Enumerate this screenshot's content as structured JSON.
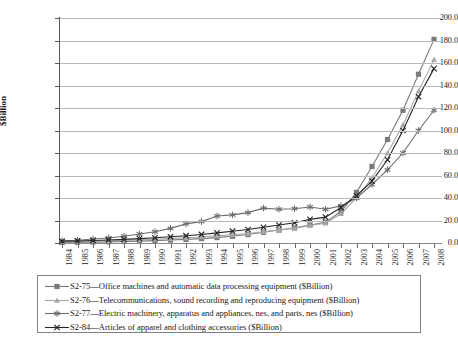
{
  "chart_data": {
    "type": "line",
    "title": "",
    "xlabel": "",
    "ylabel": "$Billion",
    "ylim": [
      0,
      200
    ],
    "ytick_step": 20,
    "grid": true,
    "legend_position": "bottom",
    "x": [
      1984,
      1985,
      1986,
      1987,
      1988,
      1989,
      1990,
      1991,
      1992,
      1993,
      1994,
      1995,
      1996,
      1997,
      1998,
      1999,
      2000,
      2001,
      2002,
      2003,
      2004,
      2005,
      2006,
      2007,
      2008
    ],
    "categories": [
      "1984",
      "1985",
      "1986",
      "1987",
      "1988",
      "1989",
      "1990",
      "1991",
      "1992",
      "1993",
      "1994",
      "1995",
      "1996",
      "1997",
      "1998",
      "1999",
      "2000",
      "2001",
      "2002",
      "2003",
      "2004",
      "2005",
      "2006",
      "2007",
      "2008"
    ],
    "ytick_labels": [
      "0.0",
      "20.0",
      "40.0",
      "60.0",
      "80.0",
      "100.0",
      "120.0",
      "140.0",
      "160.0",
      "180.0",
      "200.0"
    ],
    "series": [
      {
        "name": "S2-75-Office machines and automatic data processing equipment ($Billion)",
        "code": "S2-75",
        "description": "Office machines and automatic data processing equipment",
        "unit": "$Billion",
        "marker": "square",
        "color": "#7a7a7a",
        "values": [
          0.5,
          0.6,
          0.8,
          1.0,
          1.3,
          1.7,
          2.1,
          2.6,
          3.2,
          3.9,
          4.8,
          6.0,
          7.5,
          9.5,
          11.5,
          13.5,
          16.0,
          18.5,
          28.0,
          45.0,
          68.0,
          92.0,
          118.0,
          150.0,
          181.0
        ]
      },
      {
        "name": "S2-76-Telecommunications, sound recording and reproducing equipment ($Billion)",
        "code": "S2-76",
        "description": "Telecommunications, sound recording and reproducing equipment",
        "unit": "$Billion",
        "marker": "triangle",
        "color": "#a8a8a8",
        "values": [
          1.0,
          1.2,
          1.5,
          1.9,
          2.3,
          2.8,
          3.3,
          3.9,
          4.6,
          5.4,
          6.3,
          7.3,
          8.5,
          10.0,
          11.5,
          13.0,
          15.5,
          17.5,
          26.0,
          40.0,
          58.0,
          80.0,
          105.0,
          135.0,
          163.0
        ]
      },
      {
        "name": "S2-77-Electric machinery, apparatus and appliances, nes, and parts, nes ($Billion)",
        "code": "S2-77",
        "description": "Electric machinery, apparatus and appliances, nes, and parts, nes",
        "unit": "$Billion",
        "marker": "asterisk",
        "color": "#6e6e6e",
        "values": [
          2.0,
          2.5,
          3.5,
          4.5,
          6.0,
          8.0,
          10.0,
          13.0,
          17.0,
          19.0,
          24.0,
          25.0,
          27.0,
          31.0,
          30.0,
          30.5,
          32.0,
          30.0,
          33.0,
          40.0,
          52.0,
          65.0,
          80.0,
          100.0,
          118.0
        ]
      },
      {
        "name": "S2-84-Articles of apparel and clothing accessories ($Billion)",
        "code": "S2-84",
        "description": "Articles of apparel and clothing accessories",
        "unit": "$Billion",
        "marker": "x",
        "color": "#262626",
        "values": [
          1.5,
          1.8,
          2.2,
          2.7,
          3.2,
          3.9,
          4.6,
          5.5,
          6.5,
          7.6,
          9.0,
          10.5,
          12.0,
          14.0,
          16.0,
          18.0,
          21.0,
          23.0,
          31.5,
          42.0,
          55.0,
          74.0,
          100.0,
          130.0,
          155.0
        ]
      }
    ]
  },
  "legend": {
    "entries": [
      "S2-75—Office machines and automatic data processing equipment ($Billion)",
      "S2-76—Telecommunications, sound recording and reproducing equipment ($Billion)",
      "S2-77—Electric machinery, apparatus and appliances, nes, and parts, nes ($Billion)",
      "S2-84—Articles of apparel and clothing accessories ($Billion)"
    ]
  }
}
